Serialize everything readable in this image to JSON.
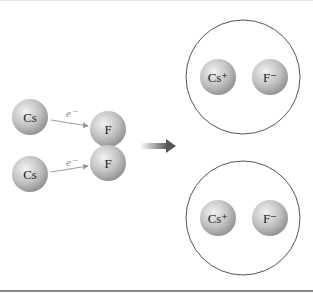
{
  "diagram": {
    "reactants": [
      {
        "cs_label": "Cs",
        "f_label": "F",
        "electron_label": "e⁻"
      },
      {
        "cs_label": "Cs",
        "f_label": "F",
        "electron_label": "e⁻"
      }
    ],
    "products": [
      {
        "cation_label": "Cs⁺",
        "anion_label": "F⁻"
      },
      {
        "cation_label": "Cs⁺",
        "anion_label": "F⁻"
      }
    ],
    "arrow": "reaction-arrow",
    "colors": {
      "sphere_light": "#ececec",
      "sphere_dark": "#9a9a9a",
      "outline": "#555555",
      "arrow": "#555555"
    }
  }
}
